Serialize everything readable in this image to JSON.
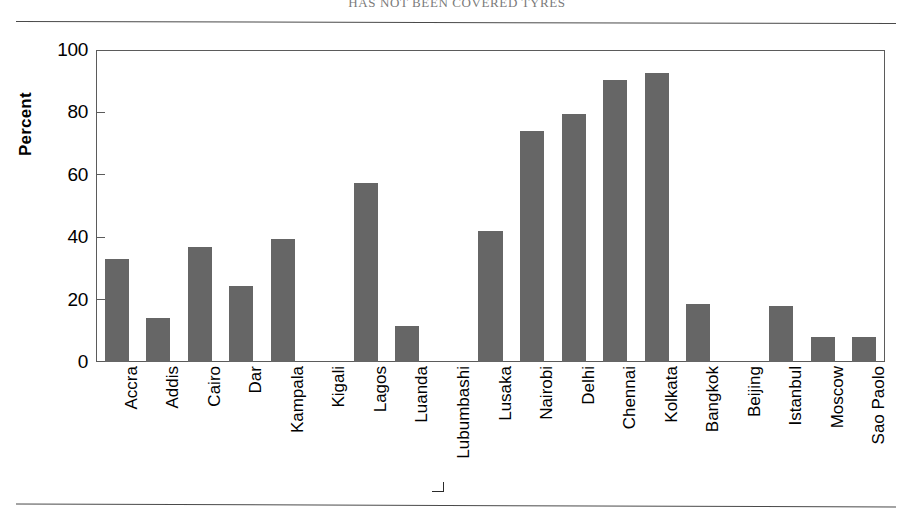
{
  "page": {
    "title": "HAS NOT BEEN COVERED TYRES",
    "rule_top_label": "top-divider",
    "rule_bottom_label": "bottom-divider"
  },
  "chart_data": {
    "type": "bar",
    "title": "",
    "xlabel": "",
    "ylabel": "Percent",
    "ylim": [
      0,
      100
    ],
    "yticks": [
      0,
      20,
      40,
      60,
      80,
      100
    ],
    "ytick_labels": [
      "0",
      "20",
      "40",
      "60",
      "80",
      "100"
    ],
    "grid": false,
    "legend": null,
    "bar_color": "#666666",
    "frame_color": "#5b5b5b",
    "categories": [
      "Accra",
      "Addis",
      "Cairo",
      "Dar",
      "Kampala",
      "Kigali",
      "Lagos",
      "Luanda",
      "Lubumbashi",
      "Lusaka",
      "Nairobi",
      "Delhi",
      "Chennai",
      "Kolkata",
      "Bangkok",
      "Beijing",
      "Istanbul",
      "Moscow",
      "Sao Paolo"
    ],
    "values": [
      33,
      14,
      37,
      24.5,
      39.5,
      0,
      57.5,
      11.5,
      0,
      42,
      74,
      79.5,
      90.5,
      92.5,
      18.5,
      0,
      18,
      8,
      8
    ]
  }
}
